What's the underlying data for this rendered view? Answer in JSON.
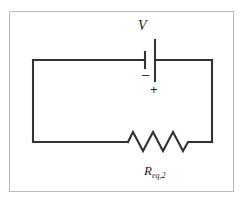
{
  "figure": {
    "kind": "circuit-schematic",
    "frame_color": "#b9b9b9",
    "wire_color": "#333333",
    "background": "#ffffff",
    "labels": {
      "source": "V",
      "negative_terminal": "–",
      "positive_terminal": "+",
      "resistor_symbol": "R",
      "resistor_subscript": "eq,2"
    },
    "components": [
      {
        "name": "voltage-source",
        "type": "battery",
        "label": "V",
        "terminals": [
          "–",
          "+"
        ],
        "position": "top-branch-center"
      },
      {
        "name": "equivalent-resistor",
        "type": "resistor",
        "label": "R",
        "subscript": "eq,2",
        "zigzag_peaks": 3,
        "position": "bottom-branch-center"
      }
    ],
    "geometry": {
      "loop_left_x": 33,
      "loop_right_x": 212,
      "loop_top_y": 60,
      "loop_bottom_y": 142,
      "battery_short_plate_x": 145,
      "battery_long_plate_x": 155,
      "resistor_start_x": 128,
      "resistor_end_x": 190,
      "resistor_peak_y": 132,
      "resistor_valley_y": 151
    }
  }
}
